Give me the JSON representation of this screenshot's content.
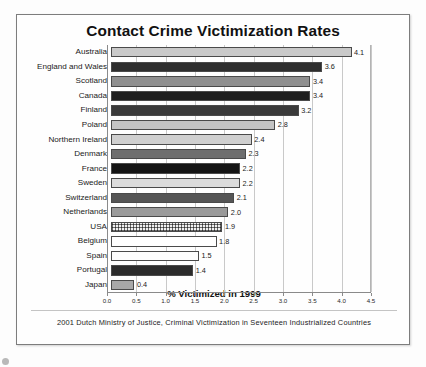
{
  "chart_data": {
    "type": "bar",
    "orientation": "horizontal",
    "title": "Contact Crime Victimization Rates",
    "xlabel": "% Victimized in 1999",
    "ylabel": "",
    "xlim": [
      0.0,
      4.5
    ],
    "grid": true,
    "legend": "none",
    "source_note": "2001 Dutch Ministry of Justice, Criminal Victimization in Seventeen Industrialized Countries",
    "tick_labels": [
      "0.0",
      "0.5",
      "1.0",
      "1.5",
      "2.0",
      "2.5",
      "3.0",
      "3.5",
      "4.0",
      "4.5"
    ],
    "ticks": [
      0.0,
      0.5,
      1.0,
      1.5,
      2.0,
      2.5,
      3.0,
      3.5,
      4.0,
      4.5
    ],
    "categories": [
      "Australia",
      "England and Wales",
      "Scotland",
      "Canada",
      "Finland",
      "Poland",
      "Northern Ireland",
      "Denmark",
      "France",
      "Sweden",
      "Switzerland",
      "Netherlands",
      "USA",
      "Belgium",
      "Spain",
      "Portugal",
      "Japan"
    ],
    "values": [
      4.1,
      3.6,
      3.4,
      3.4,
      3.2,
      2.8,
      2.4,
      2.3,
      2.2,
      2.2,
      2.1,
      2.0,
      1.9,
      1.8,
      1.5,
      1.4,
      0.4
    ],
    "value_labels": [
      "4.1",
      "3.6",
      "3.4",
      "3.4",
      "3.2",
      "2.8",
      "2.4",
      "2.3",
      "2.2",
      "2.2",
      "2.1",
      "2.0",
      "1.9",
      "1.8",
      "1.5",
      "1.4",
      "0.4"
    ],
    "bar_fills": [
      "#c9c9c9",
      "#2e2e2e",
      "#8f8f8f",
      "#1f1f1f",
      "#3a3a3a",
      "#c4c4c4",
      "#cfcfcf",
      "#6e6e6e",
      "#141414",
      "#dcdcdc",
      "#555555",
      "#9a9a9a",
      "hatch-grid",
      "#ffffff",
      "#fdfdfd",
      "#2b2b2b",
      "#a8a8a8"
    ]
  },
  "colors": {
    "frame_border": "#7d7d7d",
    "gridline": "#c9c9c9",
    "axis": "#8a8a8a",
    "text": "#111111"
  }
}
